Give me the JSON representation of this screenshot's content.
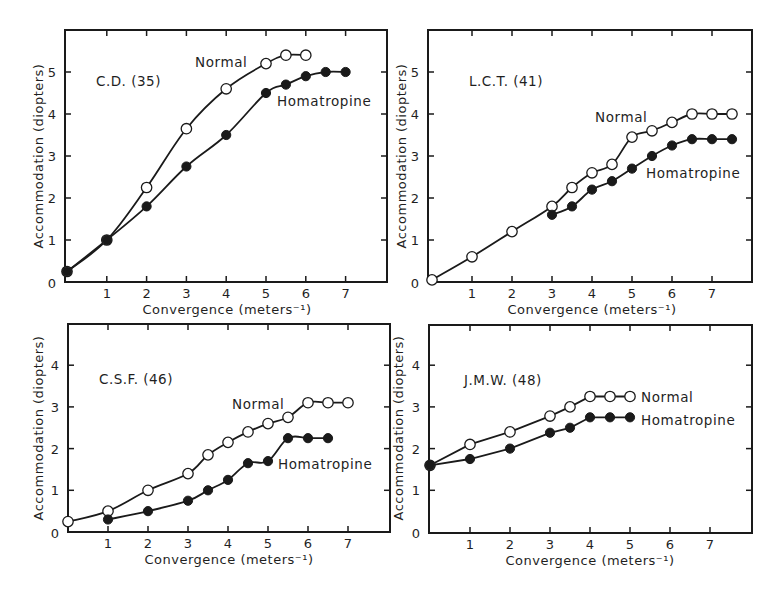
{
  "figure": {
    "xlabel": "Convergence (meters⁻¹)",
    "ylabel": "Accommodation (diopters)"
  },
  "chart_data": [
    {
      "type": "line",
      "title": "C.D. (35)",
      "xlabel": "Convergence (meters⁻¹)",
      "ylabel": "Accommodation (diopters)",
      "x_ticks": [
        0,
        1,
        2,
        3,
        4,
        5,
        6,
        7
      ],
      "y_ticks": [
        0,
        1,
        2,
        3,
        4,
        5
      ],
      "xlim": [
        0,
        8
      ],
      "ylim": [
        0,
        6
      ],
      "grid": false,
      "series": [
        {
          "name": "Normal",
          "marker": "open-circle",
          "x": [
            0,
            1,
            2,
            3,
            4,
            5,
            5.5,
            6
          ],
          "y": [
            0.25,
            1.0,
            2.25,
            3.65,
            4.6,
            5.2,
            5.4,
            5.4
          ]
        },
        {
          "name": "Homatropine",
          "marker": "filled-circle",
          "x": [
            0,
            1,
            2,
            3,
            4,
            5,
            5.5,
            6,
            6.5,
            7
          ],
          "y": [
            0.25,
            1.0,
            1.8,
            2.75,
            3.5,
            4.5,
            4.7,
            4.9,
            5.0,
            5.0
          ]
        }
      ],
      "annotations": [
        {
          "text": "Normal",
          "near": "Normal curve"
        },
        {
          "text": "Homatropine",
          "near": "Homatropine curve"
        }
      ]
    },
    {
      "type": "line",
      "title": "L.C.T. (41)",
      "xlabel": "Convergence (meters⁻¹)",
      "ylabel": "Accommodation (diopters)",
      "x_ticks": [
        0,
        1,
        2,
        3,
        4,
        5,
        6,
        7
      ],
      "y_ticks": [
        0,
        1,
        2,
        3,
        4,
        5
      ],
      "xlim": [
        0,
        8
      ],
      "ylim": [
        0,
        6
      ],
      "grid": false,
      "series": [
        {
          "name": "Normal",
          "marker": "open-circle",
          "x": [
            0,
            1,
            2,
            3,
            3.5,
            4,
            4.5,
            5,
            5.5,
            6,
            6.5,
            7,
            7.5
          ],
          "y": [
            0.05,
            0.6,
            1.2,
            1.8,
            2.25,
            2.6,
            2.8,
            3.45,
            3.6,
            3.8,
            4.0,
            4.0,
            4.0
          ]
        },
        {
          "name": "Homatropine",
          "marker": "filled-circle",
          "x": [
            3,
            3.5,
            4,
            4.5,
            5,
            5.5,
            6,
            6.5,
            7,
            7.5
          ],
          "y": [
            1.6,
            1.8,
            2.2,
            2.4,
            2.7,
            3.0,
            3.25,
            3.4,
            3.4,
            3.4
          ]
        }
      ]
    },
    {
      "type": "line",
      "title": "C.S.F. (46)",
      "xlabel": "Convergence (meters⁻¹)",
      "ylabel": "Accommodation (diopters)",
      "x_ticks": [
        0,
        1,
        2,
        3,
        4,
        5,
        6,
        7
      ],
      "y_ticks": [
        0,
        1,
        2,
        3,
        4
      ],
      "xlim": [
        0,
        8
      ],
      "ylim": [
        0,
        5
      ],
      "grid": false,
      "series": [
        {
          "name": "Normal",
          "marker": "open-circle",
          "x": [
            0,
            1,
            2,
            3,
            3.5,
            4,
            4.5,
            5,
            5.5,
            6,
            6.5,
            7
          ],
          "y": [
            0.25,
            0.5,
            1.0,
            1.4,
            1.85,
            2.15,
            2.4,
            2.6,
            2.75,
            3.1,
            3.1,
            3.1
          ]
        },
        {
          "name": "Homatropine",
          "marker": "filled-circle",
          "x": [
            1,
            2,
            3,
            3.5,
            4,
            4.5,
            5,
            5.5,
            6,
            6.5
          ],
          "y": [
            0.3,
            0.5,
            0.75,
            1.0,
            1.25,
            1.65,
            1.7,
            2.25,
            2.25,
            2.25
          ]
        }
      ]
    },
    {
      "type": "line",
      "title": "J.M.W. (48)",
      "xlabel": "Convergence (meters⁻¹)",
      "ylabel": "Accommodation (diopters)",
      "x_ticks": [
        0,
        1,
        2,
        3,
        4,
        5,
        6,
        7
      ],
      "y_ticks": [
        0,
        1,
        2,
        3,
        4
      ],
      "xlim": [
        0,
        8
      ],
      "ylim": [
        0,
        5
      ],
      "grid": false,
      "series": [
        {
          "name": "Normal",
          "marker": "open-circle",
          "x": [
            0,
            1,
            2,
            3,
            3.5,
            4,
            4.5,
            5
          ],
          "y": [
            1.6,
            2.1,
            2.4,
            2.78,
            3.0,
            3.25,
            3.25,
            3.25
          ]
        },
        {
          "name": "Homatropine",
          "marker": "filled-circle",
          "x": [
            0,
            1,
            2,
            3,
            3.5,
            4,
            4.5,
            5
          ],
          "y": [
            1.6,
            1.75,
            2.0,
            2.38,
            2.5,
            2.75,
            2.75,
            2.75
          ]
        }
      ]
    }
  ],
  "panels": [
    {
      "id": "cd",
      "subject": "C.D. (35)",
      "normal_label": "Normal",
      "homatropine_label": "Homatropine"
    },
    {
      "id": "lct",
      "subject": "L.C.T. (41)",
      "normal_label": "Normal",
      "homatropine_label": "Homatropine"
    },
    {
      "id": "csf",
      "subject": "C.S.F. (46)",
      "normal_label": "Normal",
      "homatropine_label": "Homatropine"
    },
    {
      "id": "jmw",
      "subject": "J.M.W. (48)",
      "normal_label": "Normal",
      "homatropine_label": "Homatropine"
    }
  ]
}
